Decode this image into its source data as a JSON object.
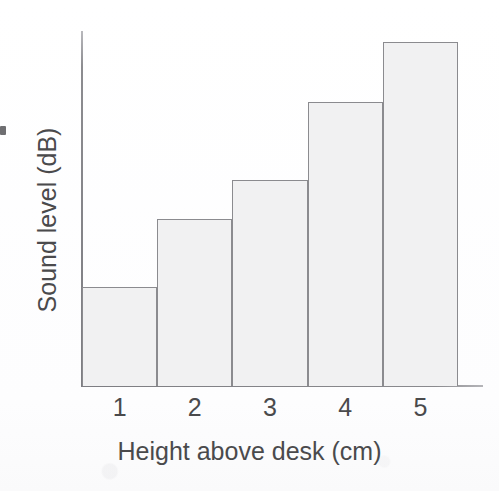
{
  "figure": {
    "background_color": "#ffffff",
    "axis_color": "#8b8b8f",
    "bar_fill_color": "#f1f1f2",
    "bar_edge_color": "#8b8b8f",
    "text_color": "#4a4a4c",
    "edge_mark_label": ""
  },
  "chart_data": {
    "type": "bar",
    "title": "",
    "subtitle": "",
    "xlabel": "Height above desk (cm)",
    "ylabel": "Sound level (dB)",
    "categories": [
      "1",
      "2",
      "3",
      "4",
      "5"
    ],
    "values": [
      28,
      47,
      58,
      80,
      97
    ],
    "value_units": "relative (% of plotted axis height; y-axis is unlabelled)",
    "ylim": [
      0,
      100
    ],
    "y_tick_labels": [],
    "x_tick_labels": [
      "1",
      "2",
      "3",
      "4",
      "5"
    ],
    "grid": false,
    "legend": null,
    "legend_position": "none",
    "annotations": []
  }
}
